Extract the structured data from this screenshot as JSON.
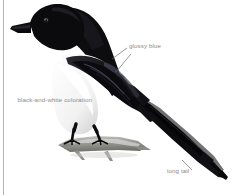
{
  "figure": {
    "alt": "Illustration of a black-billed magpie perched on a branch, facing left, with a very long tail angled down to the right",
    "background_color": "#ffffff",
    "rule_color": "#b4b4b4",
    "label_color": "#8a8a8a",
    "leader_color": "#6e6e6e",
    "plumage_black": "#111111",
    "plumage_white": "#ffffff",
    "branch_gray": "#9a9a97"
  },
  "callouts": [
    {
      "id": "glossy-blue",
      "text": "glossy blue",
      "target": "wing"
    },
    {
      "id": "coloration",
      "text": "black-and-white coloration",
      "line1": "black-and-white",
      "line2": "coloration",
      "target": "breast"
    },
    {
      "id": "long-tail",
      "text": "long tail",
      "target": "tail"
    }
  ]
}
